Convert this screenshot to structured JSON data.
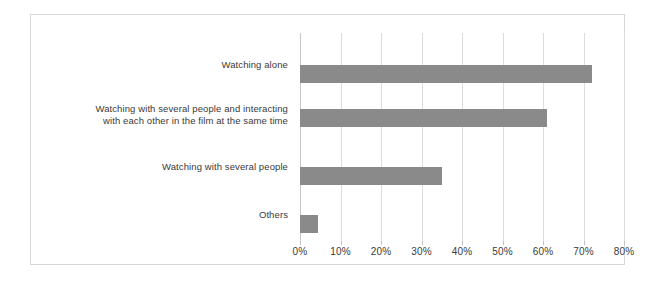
{
  "chart_data": {
    "type": "bar",
    "orientation": "horizontal",
    "title": "",
    "subtitle": "",
    "xlabel": "",
    "ylabel": "",
    "categories": [
      "Watching alone",
      "Watching with several people and interacting with each other in the film at the same time",
      "Watching with several people",
      "Others"
    ],
    "category_lines": [
      [
        "Watching alone"
      ],
      [
        "Watching with several people and interacting",
        "with each other in the film at the same time"
      ],
      [
        "Watching with several people"
      ],
      [
        "Others"
      ]
    ],
    "values": [
      72,
      61,
      35,
      4.5
    ],
    "value_unit": "%",
    "xlim": [
      0,
      80
    ],
    "xticks": [
      0,
      10,
      20,
      30,
      40,
      50,
      60,
      70,
      80
    ],
    "xtick_labels": [
      "0%",
      "10%",
      "20%",
      "30%",
      "40%",
      "50%",
      "60%",
      "70%",
      "80%"
    ],
    "grid": true,
    "grid_axis": "x",
    "legend": false,
    "legend_position": "none",
    "bar_color": "#8a8a8a",
    "gridline_color": "#dcdcdc",
    "frame_color": "#d8d8d8",
    "background_color": "#ffffff",
    "text_color": "#3a3a3a"
  }
}
